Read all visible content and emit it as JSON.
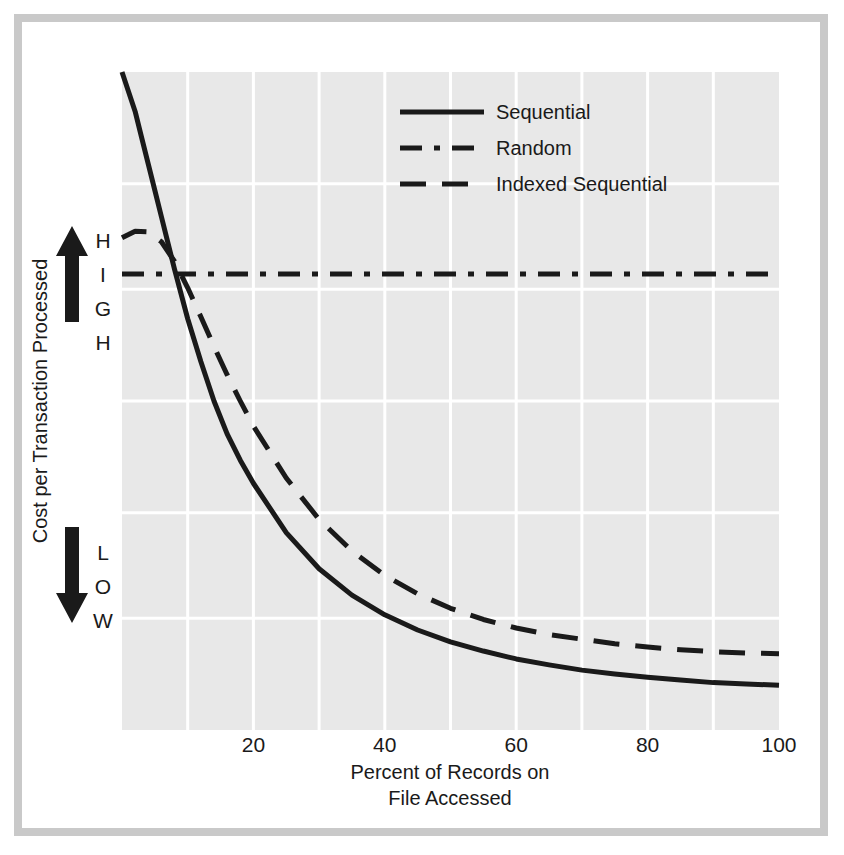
{
  "figure": {
    "background_color": "#ffffff",
    "frame_color": "#c9c9c9",
    "plot_background_color": "#e8e8e8",
    "grid_color": "#ffffff",
    "ink_color": "#1a1a1a"
  },
  "axes": {
    "x_title_line1": "Percent of Records on",
    "x_title_line2": "File Accessed",
    "y_title": "Cost per Transaction Processed",
    "y_high_label": "HIGH",
    "y_low_label": "LOW",
    "up_arrow_icon": "up-arrow-icon",
    "down_arrow_icon": "down-arrow-icon"
  },
  "legend": {
    "entries": [
      {
        "label": "Sequential",
        "style": "solid",
        "color": "#1a1a1a"
      },
      {
        "label": "Random",
        "style": "dash-dot",
        "color": "#1a1a1a"
      },
      {
        "label": "Indexed Sequential",
        "style": "dashed",
        "color": "#1a1a1a"
      }
    ]
  },
  "chart_data": {
    "type": "line",
    "title": "",
    "subtitle": "",
    "xlabel": "Percent of Records on File Accessed",
    "ylabel": "Cost per Transaction Processed",
    "xlim": [
      0,
      100
    ],
    "ylim": [
      0,
      1
    ],
    "xticks": [
      20,
      40,
      60,
      80,
      100
    ],
    "xtick_labels": [
      "20",
      "40",
      "60",
      "80",
      "100"
    ],
    "yticks": [],
    "ytick_labels": [],
    "y_axis_qualitative": [
      "LOW",
      "HIGH"
    ],
    "grid": true,
    "grid_x_values": [
      10,
      20,
      30,
      40,
      50,
      60,
      70,
      80,
      90
    ],
    "grid_y_fractions": [
      0.17,
      0.33,
      0.5,
      0.67,
      0.83
    ],
    "legend_position": "top-center-right",
    "annotations": [
      "Up arrow beside the vertical word HIGH near the top of the cost axis",
      "Down arrow beside the vertical word LOW near the bottom of the cost axis"
    ],
    "series": [
      {
        "name": "Sequential",
        "style": "solid",
        "color": "#1a1a1a",
        "x": [
          0,
          1,
          2,
          3,
          4,
          5,
          6,
          7,
          8,
          10,
          12,
          14,
          16,
          18,
          20,
          25,
          30,
          35,
          40,
          45,
          50,
          55,
          60,
          65,
          70,
          75,
          80,
          85,
          90,
          95,
          100
        ],
        "y": [
          1.0,
          0.97,
          0.94,
          0.9,
          0.86,
          0.82,
          0.78,
          0.74,
          0.7,
          0.625,
          0.56,
          0.5,
          0.45,
          0.41,
          0.375,
          0.3,
          0.245,
          0.205,
          0.175,
          0.152,
          0.134,
          0.12,
          0.108,
          0.099,
          0.091,
          0.085,
          0.08,
          0.076,
          0.072,
          0.07,
          0.068
        ]
      },
      {
        "name": "Random",
        "style": "dash-dot",
        "color": "#1a1a1a",
        "x": [
          0,
          100
        ],
        "y": [
          0.693,
          0.693
        ],
        "note": "constant cost, independent of percent of file accessed"
      },
      {
        "name": "Indexed Sequential",
        "style": "dashed",
        "color": "#1a1a1a",
        "x": [
          0,
          2,
          4,
          6,
          8,
          10,
          12,
          14,
          16,
          18,
          20,
          25,
          30,
          35,
          40,
          45,
          50,
          55,
          60,
          65,
          70,
          75,
          80,
          85,
          90,
          95,
          100
        ],
        "y": [
          0.748,
          0.758,
          0.757,
          0.742,
          0.712,
          0.672,
          0.628,
          0.583,
          0.54,
          0.5,
          0.462,
          0.383,
          0.32,
          0.272,
          0.235,
          0.207,
          0.185,
          0.168,
          0.155,
          0.145,
          0.138,
          0.131,
          0.126,
          0.122,
          0.119,
          0.117,
          0.116
        ]
      }
    ]
  }
}
